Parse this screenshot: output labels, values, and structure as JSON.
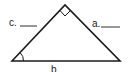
{
  "diagram": {
    "type": "right-triangle",
    "labels": {
      "side_c": "c.",
      "side_a": "a.",
      "side_b": "b"
    },
    "blanks": {
      "side_c": "____",
      "side_a": "____"
    },
    "markers": {
      "right_angle": "top-vertex",
      "angle_arc": "bottom-left-vertex"
    },
    "colors": {
      "stroke": "#1a1a1a",
      "background": "#ffffff",
      "text": "#222222"
    }
  }
}
